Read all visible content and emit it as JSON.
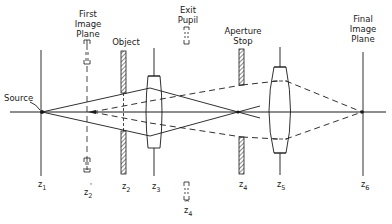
{
  "diagram": {
    "labels": {
      "source": "Source",
      "first_image_plane": "First\nImage\nPlane",
      "object": "Object",
      "exit_pupil": "Exit\nPupil",
      "aperture_stop": "Aperture\nStop",
      "final_image_plane": "Final\nImage\nPlane"
    },
    "positions": [
      {
        "id": "z1",
        "base": "z",
        "sub": "1"
      },
      {
        "id": "z2p",
        "base": "z",
        "sub": "2",
        "mark": "'"
      },
      {
        "id": "z2",
        "base": "z",
        "sub": "2"
      },
      {
        "id": "z3",
        "base": "z",
        "sub": "3"
      },
      {
        "id": "z4h",
        "base": "z",
        "sub": "4",
        "mark": "^"
      },
      {
        "id": "z4",
        "base": "z",
        "sub": "4"
      },
      {
        "id": "z5",
        "base": "z",
        "sub": "5"
      },
      {
        "id": "z6",
        "base": "z",
        "sub": "6"
      }
    ],
    "colors": {
      "line": "#1a1a1a",
      "background": "#ffffff"
    }
  }
}
